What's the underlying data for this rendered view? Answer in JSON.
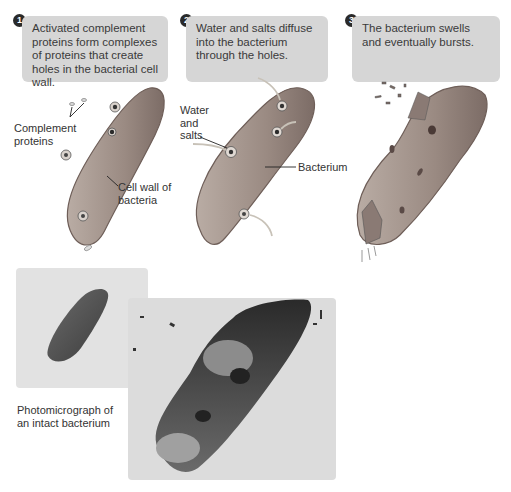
{
  "steps": [
    {
      "number": "1",
      "text": "Activated complement proteins form complexes of proteins that create holes in the bacterial cell wall."
    },
    {
      "number": "2",
      "text": "Water and salts diffuse into the bacterium through the holes."
    },
    {
      "number": "3",
      "text": "The bacterium swells and eventually bursts."
    }
  ],
  "labels": {
    "complement_proteins": "Complement proteins",
    "cell_wall": "Cell wall of bacteria",
    "water_salts": "Water and salts",
    "bacterium": "Bacterium",
    "photo_caption": "Photomicrograph of an intact bacterium"
  },
  "colors": {
    "box": "#d6d6d6",
    "bacterium_fill": "#9a8a82",
    "bacterium_edge": "#6e5e58",
    "arrow": "#c8c2b8"
  }
}
